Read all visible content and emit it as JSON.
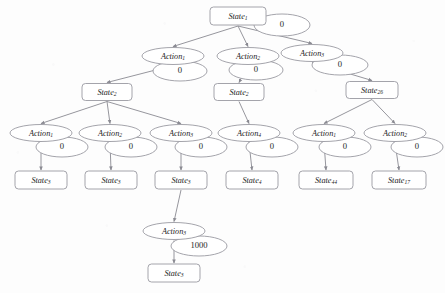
{
  "diagram": {
    "type": "tree",
    "background_color": "#fdfdfd",
    "node_fill": "#ffffff",
    "node_stroke": "#9a9aa2",
    "edge_color": "#8a8a92",
    "text_color": "#1c1c1c",
    "state_shape": "rounded-rectangle",
    "action_shape": "ellipse",
    "reward_shape": "ellipse",
    "nodes": [
      {
        "id": "s1",
        "kind": "state",
        "label": "State",
        "sub": "1",
        "x": 238,
        "y": 16,
        "w": 56,
        "h": 18,
        "reward": "0",
        "reward_x": 282,
        "reward_y": 25,
        "reward_rx": 28,
        "reward_ry": 11
      },
      {
        "id": "a1_1",
        "kind": "action",
        "label": "Action",
        "sub": "1",
        "x": 173,
        "y": 56,
        "w": 62,
        "h": 17,
        "reward": "0",
        "reward_x": 180,
        "reward_y": 71,
        "reward_rx": 27,
        "reward_ry": 10
      },
      {
        "id": "a1_2",
        "kind": "action",
        "label": "Action",
        "sub": "2",
        "x": 248,
        "y": 56,
        "w": 62,
        "h": 17,
        "reward": "0",
        "reward_x": 256,
        "reward_y": 70,
        "reward_rx": 27,
        "reward_ry": 10
      },
      {
        "id": "a1_3",
        "kind": "action",
        "label": "Action",
        "sub": "3",
        "x": 312,
        "y": 53,
        "w": 62,
        "h": 17,
        "reward": "0",
        "reward_x": 340,
        "reward_y": 65,
        "reward_rx": 28,
        "reward_ry": 10
      },
      {
        "id": "s2_a",
        "kind": "state",
        "label": "State",
        "sub": "2",
        "x": 107,
        "y": 92,
        "w": 50,
        "h": 17,
        "reward": null
      },
      {
        "id": "s2_b",
        "kind": "state",
        "label": "State",
        "sub": "2",
        "x": 239,
        "y": 92,
        "w": 50,
        "h": 17,
        "reward": null
      },
      {
        "id": "s26",
        "kind": "state",
        "label": "State",
        "sub": "26",
        "x": 372,
        "y": 90,
        "w": 52,
        "h": 17,
        "reward": null
      },
      {
        "id": "a2_1",
        "kind": "action",
        "label": "Action",
        "sub": "1",
        "x": 41,
        "y": 133,
        "w": 62,
        "h": 17,
        "reward": "0",
        "reward_x": 62,
        "reward_y": 147,
        "reward_rx": 26,
        "reward_ry": 10
      },
      {
        "id": "a2_2",
        "kind": "action",
        "label": "Action",
        "sub": "2",
        "x": 110,
        "y": 133,
        "w": 62,
        "h": 17,
        "reward": "0",
        "reward_x": 131,
        "reward_y": 147,
        "reward_rx": 26,
        "reward_ry": 10
      },
      {
        "id": "a2_3",
        "kind": "action",
        "label": "Action",
        "sub": "3",
        "x": 181,
        "y": 133,
        "w": 62,
        "h": 17,
        "reward": "0",
        "reward_x": 201,
        "reward_y": 147,
        "reward_rx": 26,
        "reward_ry": 10
      },
      {
        "id": "a2_4",
        "kind": "action",
        "label": "Action",
        "sub": "4",
        "x": 249,
        "y": 133,
        "w": 62,
        "h": 17,
        "reward": "0",
        "reward_x": 272,
        "reward_y": 147,
        "reward_rx": 26,
        "reward_ry": 10
      },
      {
        "id": "a3_1",
        "kind": "action",
        "label": "Action",
        "sub": "1",
        "x": 324,
        "y": 133,
        "w": 62,
        "h": 17,
        "reward": "0",
        "reward_x": 345,
        "reward_y": 147,
        "reward_rx": 26,
        "reward_ry": 10
      },
      {
        "id": "a3_2",
        "kind": "action",
        "label": "Action",
        "sub": "2",
        "x": 395,
        "y": 133,
        "w": 62,
        "h": 17,
        "reward": "0",
        "reward_x": 417,
        "reward_y": 147,
        "reward_rx": 26,
        "reward_ry": 10
      },
      {
        "id": "l_s3a",
        "kind": "state",
        "label": "State",
        "sub": "3",
        "x": 41,
        "y": 180,
        "w": 52,
        "h": 18,
        "reward": null
      },
      {
        "id": "l_s3b",
        "kind": "state",
        "label": "State",
        "sub": "3",
        "x": 111,
        "y": 180,
        "w": 52,
        "h": 18,
        "reward": null
      },
      {
        "id": "l_s3c",
        "kind": "state",
        "label": "State",
        "sub": "3",
        "x": 181,
        "y": 180,
        "w": 52,
        "h": 18,
        "reward": null
      },
      {
        "id": "l_s4",
        "kind": "state",
        "label": "State",
        "sub": "4",
        "x": 252,
        "y": 180,
        "w": 52,
        "h": 18,
        "reward": null
      },
      {
        "id": "l_s44",
        "kind": "state",
        "label": "State",
        "sub": "44",
        "x": 326,
        "y": 180,
        "w": 54,
        "h": 18,
        "reward": null
      },
      {
        "id": "l_s17",
        "kind": "state",
        "label": "State",
        "sub": "17",
        "x": 399,
        "y": 180,
        "w": 54,
        "h": 18,
        "reward": null
      },
      {
        "id": "a4_3",
        "kind": "action",
        "label": "Action",
        "sub": "3",
        "x": 174,
        "y": 231,
        "w": 62,
        "h": 17,
        "reward": "1000",
        "reward_x": 199,
        "reward_y": 246,
        "reward_rx": 28,
        "reward_ry": 10
      },
      {
        "id": "f_s3",
        "kind": "state",
        "label": "State",
        "sub": "3",
        "x": 174,
        "y": 273,
        "w": 52,
        "h": 18,
        "reward": null
      }
    ],
    "edges": [
      {
        "from": "s1",
        "to": "a1_1"
      },
      {
        "from": "s1",
        "to": "a1_2"
      },
      {
        "from": "s1",
        "to": "a1_3"
      },
      {
        "from": "a1_1",
        "to": "s2_a"
      },
      {
        "from": "a1_2",
        "to": "s2_b"
      },
      {
        "from": "a1_3",
        "to": "s26"
      },
      {
        "from": "s2_a",
        "to": "a2_1"
      },
      {
        "from": "s2_a",
        "to": "a2_2"
      },
      {
        "from": "s2_a",
        "to": "a2_3"
      },
      {
        "from": "s2_b",
        "to": "a2_4"
      },
      {
        "from": "s26",
        "to": "a3_1"
      },
      {
        "from": "s26",
        "to": "a3_2"
      },
      {
        "from": "a2_1",
        "to": "l_s3a"
      },
      {
        "from": "a2_2",
        "to": "l_s3b"
      },
      {
        "from": "a2_3",
        "to": "l_s3c"
      },
      {
        "from": "a2_4",
        "to": "l_s4"
      },
      {
        "from": "a3_1",
        "to": "l_s44"
      },
      {
        "from": "a3_2",
        "to": "l_s17"
      },
      {
        "from": "l_s3c",
        "to": "a4_3"
      },
      {
        "from": "a4_3",
        "to": "f_s3"
      }
    ]
  }
}
